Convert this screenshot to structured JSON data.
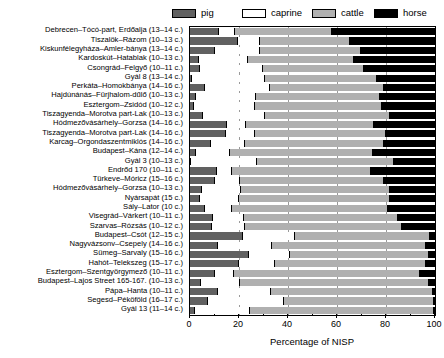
{
  "chart_data": {
    "type": "bar",
    "subtype": "stacked-horizontal-100pct",
    "title": "",
    "xlabel": "Percentage of NISP",
    "ylabel": "",
    "xlim": [
      0,
      100
    ],
    "xticks": [
      0,
      20,
      40,
      60,
      80,
      100
    ],
    "xtick_labels": [
      "0",
      "20",
      "40",
      "60",
      "80",
      "100"
    ],
    "grid": true,
    "legend_position": "top",
    "legend": [
      {
        "name": "pig",
        "color": "#616161",
        "icon": "legend-swatch-pig"
      },
      {
        "name": "caprine",
        "color": "#ffffff",
        "icon": "legend-swatch-caprine"
      },
      {
        "name": "cattle",
        "color": "#b0b0b0",
        "icon": "legend-swatch-cattle"
      },
      {
        "name": "horse",
        "color": "#000000",
        "icon": "legend-swatch-horse"
      }
    ],
    "series_order": [
      "pig",
      "caprine",
      "cattle",
      "horse"
    ],
    "categories": [
      "Debrecen–Tócó-part, Erdőalja (13–14 c.)",
      "Tiszalök–Rázom (10–13 c.)",
      "Kiskunfélegyháza–Amler-bánya (13–14 c.)",
      "Kardoskút–Hatablak (10–13 c.)",
      "Csongrád–Felgyő (10–11 c.)",
      "Gyál 8 (13–14 c.)",
      "Perkáta–Homokbánya (14–16 c.)",
      "Hajdúnánás–Fürjhalom-dűlő (10–13 c.)",
      "Esztergom–Zsidód (10–12 c.)",
      "Tiszagyenda–Morotva part-Lak (10–13 c.)",
      "Hódmezővásárhely–Gorzsa (14–16 c.)",
      "Tiszagyenda–Morotva part-Lak (14–16 c.)",
      "Karcag–Orgondaszentmiklós (14–16 c.)",
      "Budapest–Kána (12–14 c.)",
      "Gyál 3 (10–13 c.)",
      "Endrőd 170 (10–11 c.)",
      "Türkeve–Móricz (15–16 c.)",
      "Hódmezővásárhely–Gorzsa (10–13 c.)",
      "Nyársapát      (15 c.)",
      "Sály–Lator       (10 c.)",
      "Visegrád–Várkert (10–11 c.)",
      "Szarvas–Rózsás (10–12 c.)",
      "Budapest–Csót (12–15 c.)",
      "Nagyvázsonv–Csepely (14–16 c.)",
      "Sümeg–Sarvaly (15–16 c.)",
      "Hahót–Telekszeg (15–17 c.)",
      "Esztergom–Szentgyörgymező (10–11 c.)",
      "Budapest–Lajos Street 165-167. (10–13 c.)",
      "Pápa–Hanta (10–11 c.)",
      "Segesd–Péköföld (16–17 c.)",
      "Gyál 13 (11–14 c.)"
    ],
    "series": [
      {
        "name": "pig",
        "values": [
          12.0,
          19.5,
          10.0,
          3.5,
          4.0,
          1.0,
          6.0,
          2.5,
          1.5,
          5.5,
          15.0,
          14.5,
          8.5,
          2.5,
          0.0,
          11.0,
          10.0,
          5.0,
          4.0,
          6.0,
          9.5,
          9.0,
          21.5,
          11.5,
          24.0,
          20.0,
          10.0,
          4.5,
          11.5,
          7.5,
          2.0
        ]
      },
      {
        "name": "caprine",
        "values": [
          6.5,
          9.0,
          18.5,
          20.0,
          26.0,
          29.5,
          26.5,
          24.5,
          25.0,
          25.0,
          8.0,
          12.0,
          14.0,
          14.0,
          27.0,
          6.0,
          10.5,
          16.0,
          16.0,
          11.0,
          12.5,
          13.5,
          21.5,
          22.0,
          17.0,
          14.5,
          8.0,
          16.0,
          21.5,
          31.0,
          22.5
        ]
      },
      {
        "name": "cattle",
        "values": [
          39.5,
          37.0,
          41.5,
          43.5,
          41.0,
          46.0,
          46.5,
          50.5,
          52.0,
          51.0,
          52.0,
          53.5,
          56.5,
          58.0,
          56.0,
          57.0,
          58.5,
          60.5,
          61.5,
          64.0,
          63.0,
          64.0,
          55.0,
          63.0,
          56.5,
          62.0,
          76.0,
          77.0,
          66.0,
          61.0,
          75.0
        ]
      },
      {
        "name": "horse",
        "values": [
          42.0,
          34.5,
          30.0,
          33.0,
          29.0,
          23.5,
          21.0,
          22.5,
          21.5,
          18.5,
          25.0,
          20.0,
          21.0,
          25.5,
          17.0,
          26.0,
          21.0,
          18.5,
          18.5,
          19.0,
          15.0,
          13.5,
          2.0,
          3.5,
          2.5,
          3.5,
          6.0,
          2.5,
          1.0,
          0.5,
          0.5
        ]
      }
    ]
  }
}
